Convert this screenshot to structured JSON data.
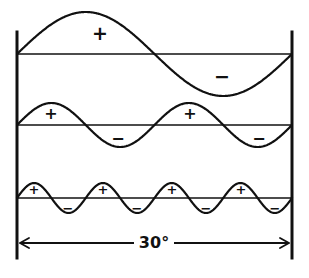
{
  "figure": {
    "background_color": "#ffffff",
    "ink_color": "#111111",
    "width": 309,
    "height": 278
  },
  "axes": {
    "left_axis_x": 17,
    "right_axis_x": 292,
    "top_y": 32,
    "bottom_y": 258,
    "stroke_width": 3
  },
  "dimension": {
    "label": "30°",
    "line_y": 243,
    "start_x": 20,
    "end_x": 289,
    "arrow_style": "double-headed",
    "label_x": 154,
    "label_y": 243
  },
  "chart_data": {
    "type": "line",
    "xlabel": "30°",
    "ylabel": "",
    "grid": false,
    "legend": "none",
    "x_range_degrees": [
      0,
      30
    ],
    "baselines_y": [
      54,
      125,
      198
    ],
    "series": [
      {
        "name": "fundamental",
        "row": 1,
        "cycles": 1,
        "amplitude_px": 42,
        "baseline_y": 54,
        "phase": "sine-positive-first",
        "signs": [
          {
            "label": "+",
            "x": 100,
            "y": 34
          },
          {
            "label": "−",
            "x": 222,
            "y": 77
          }
        ]
      },
      {
        "name": "second-harmonic",
        "row": 2,
        "cycles": 2,
        "amplitude_px": 22,
        "baseline_y": 125,
        "phase": "sine-positive-first",
        "signs": [
          {
            "label": "+",
            "x": 51,
            "y": 114
          },
          {
            "label": "−",
            "x": 118,
            "y": 139
          },
          {
            "label": "+",
            "x": 190,
            "y": 114
          },
          {
            "label": "−",
            "x": 259,
            "y": 139
          }
        ]
      },
      {
        "name": "fourth-harmonic",
        "row": 3,
        "cycles": 4,
        "amplitude_px": 15,
        "baseline_y": 198,
        "phase": "sine-positive-first",
        "signs": [
          {
            "label": "+",
            "x": 34,
            "y": 190
          },
          {
            "label": "−",
            "x": 68,
            "y": 209
          },
          {
            "label": "+",
            "x": 103,
            "y": 190
          },
          {
            "label": "−",
            "x": 137,
            "y": 209
          },
          {
            "label": "+",
            "x": 172,
            "y": 190
          },
          {
            "label": "−",
            "x": 206,
            "y": 209
          },
          {
            "label": "+",
            "x": 241,
            "y": 190
          },
          {
            "label": "−",
            "x": 275,
            "y": 209
          }
        ]
      }
    ]
  }
}
